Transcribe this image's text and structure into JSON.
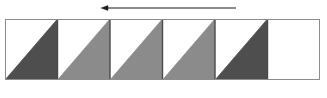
{
  "figure": {
    "name": "tape-strip-with-direction-arrow",
    "background_color": "#ffffff",
    "width": 327,
    "height": 98
  },
  "arrow": {
    "name": "direction-arrow",
    "label": "",
    "direction": "left",
    "color": "#1a1a1a",
    "x_start": 236,
    "x_end": 101,
    "y": 8,
    "line_width": 1.2,
    "head_length": 7,
    "head_width": 5
  },
  "strip": {
    "name": "cell-strip",
    "x": 5,
    "y": 19,
    "width": 315,
    "height": 61,
    "cell_count": 6,
    "cell_width": 52.5,
    "border_color": "#8c8c8c",
    "border_width": 1,
    "fill_color": "#ffffff",
    "divider_color": "#4a4a4a",
    "divider_width": 1.4,
    "cells": [
      {
        "index": 1,
        "name": "cell-1",
        "upper_fill": "#ffffff",
        "lower_fill": "#4e4e4e",
        "shade": "dark",
        "has_triangle": true
      },
      {
        "index": 2,
        "name": "cell-2",
        "upper_fill": "#ffffff",
        "lower_fill": "#8b8b8b",
        "shade": "medium",
        "has_triangle": true
      },
      {
        "index": 3,
        "name": "cell-3",
        "upper_fill": "#ffffff",
        "lower_fill": "#8b8b8b",
        "shade": "medium",
        "has_triangle": true
      },
      {
        "index": 4,
        "name": "cell-4",
        "upper_fill": "#ffffff",
        "lower_fill": "#8b8b8b",
        "shade": "medium",
        "has_triangle": true
      },
      {
        "index": 5,
        "name": "cell-5",
        "upper_fill": "#ffffff",
        "lower_fill": "#4e4e4e",
        "shade": "dark",
        "has_triangle": true
      },
      {
        "index": 6,
        "name": "cell-6",
        "upper_fill": "#ffffff",
        "lower_fill": "#ffffff",
        "shade": "empty",
        "has_triangle": false
      }
    ]
  }
}
